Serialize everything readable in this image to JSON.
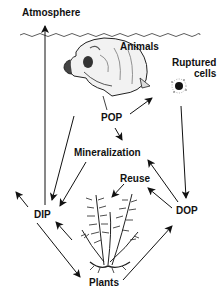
{
  "diagram": {
    "labels": {
      "atmosphere": "Atmosphere",
      "animals": "Animals",
      "ruptured_line1": "Ruptured",
      "ruptured_line2": "cells",
      "pop": "POP",
      "mineralization": "Mineralization",
      "reuse": "Reuse",
      "dip": "DIP",
      "dop": "DOP",
      "plants": "Plants"
    },
    "nodes": [
      "Atmosphere",
      "Animals",
      "Ruptured cells",
      "POP",
      "Mineralization",
      "Reuse",
      "DIP",
      "DOP",
      "Plants"
    ],
    "edges": [
      {
        "from": "DIP",
        "to": "Atmosphere"
      },
      {
        "from": "Animals",
        "to": "DIP"
      },
      {
        "from": "Mineralization",
        "to": "DIP"
      },
      {
        "from": "Animals",
        "to": "POP"
      },
      {
        "from": "POP",
        "to": "Ruptured cells"
      },
      {
        "from": "POP",
        "to": "Mineralization"
      },
      {
        "from": "Ruptured cells",
        "to": "DOP"
      },
      {
        "from": "DOP",
        "to": "Mineralization"
      },
      {
        "from": "DOP",
        "to": "Reuse"
      },
      {
        "from": "Reuse",
        "to": "Plants"
      },
      {
        "from": "Plants",
        "to": "DIP"
      },
      {
        "from": "DIP",
        "to": "Plants"
      },
      {
        "from": "Plants",
        "to": "DOP"
      },
      {
        "from": "DIP",
        "to": "outflow-left"
      }
    ],
    "colors": {
      "ink": "#111111",
      "background": "#ffffff"
    }
  }
}
